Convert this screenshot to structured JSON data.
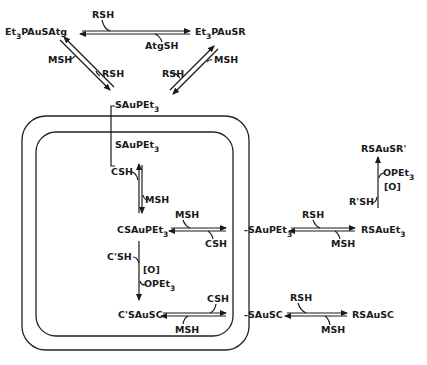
{
  "diagram": {
    "species": {
      "et3pausatg": {
        "main": "Et",
        "sub": "3",
        "rest": "PAuSAtg"
      },
      "et3pausr": {
        "main": "Et",
        "sub": "3",
        "rest": "PAuSR"
      },
      "sau_pet3_top": {
        "main": "SAuPEt",
        "sub": "3"
      },
      "sau_pet3_inner": {
        "main": "SAuPEt",
        "sub": "3"
      },
      "csaupet3": {
        "main": "CSAuPEt",
        "sub": "3"
      },
      "csausc": {
        "main": "C'SAuSC"
      },
      "sau_pet3_outer": {
        "main": "-SAuPEt",
        "sub": "3"
      },
      "rsauet3": {
        "main": "RSAuEt",
        "sub": "3"
      },
      "rsausr_prime": {
        "main": "RSAuSR'"
      },
      "sausc_outer": {
        "main": "-SAuSC"
      },
      "rsausc": {
        "main": "RSAuSC"
      }
    },
    "reagents": {
      "top_rsh": "RSH",
      "top_atgsh": "AtgSH",
      "left_msh": "MSH",
      "left_rsh": "RSH",
      "right_rsh": "RSH",
      "right_msh": "MSH",
      "inner_csh": "CSH",
      "inner_msh": "MSH",
      "mid_msh": "MSH",
      "mid_csh": "CSH",
      "ox_cprime_sh": "C'SH",
      "ox_o": "[O]",
      "ox_opet3": {
        "main": "OPEt",
        "sub": "3"
      },
      "bot_csh": "CSH",
      "bot_msh": "MSH",
      "right_mid_rsh": "RSH",
      "right_mid_msh": "MSH",
      "rprime_sh": "R'SH",
      "r_opet3": {
        "main": "OPEt",
        "sub": "3"
      },
      "r_o": "[O]",
      "rb_rsh": "RSH",
      "rb_msh": "MSH"
    }
  }
}
